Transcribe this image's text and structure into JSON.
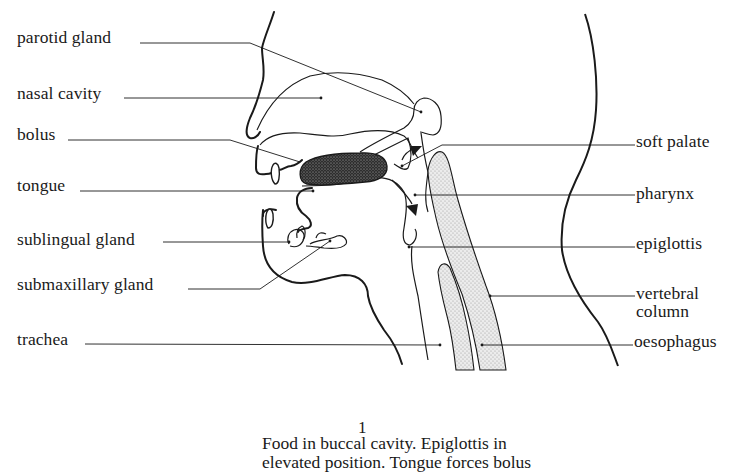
{
  "diagram": {
    "type": "anatomical-cross-section",
    "labels_left": [
      {
        "id": "parotid",
        "text": "parotid gland"
      },
      {
        "id": "nasal",
        "text": "nasal cavity"
      },
      {
        "id": "bolus",
        "text": "bolus"
      },
      {
        "id": "tongue",
        "text": "tongue"
      },
      {
        "id": "sublingual",
        "text": "sublingual gland"
      },
      {
        "id": "submaxillary",
        "text": "submaxillary gland"
      },
      {
        "id": "trachea",
        "text": "trachea"
      }
    ],
    "labels_right": [
      {
        "id": "soft_palate",
        "text": "soft palate"
      },
      {
        "id": "pharynx",
        "text": "pharynx"
      },
      {
        "id": "epiglottis",
        "text": "epiglottis"
      },
      {
        "id": "vertebral_1",
        "text": "vertebral"
      },
      {
        "id": "vertebral_2",
        "text": "column"
      },
      {
        "id": "oesophagus",
        "text": "oesophagus"
      }
    ],
    "caption": {
      "number": "1",
      "lines": [
        "Food in buccal cavity. Epiglottis in",
        "elevated position. Tongue forces bolus"
      ]
    },
    "colors": {
      "ink": "#1a1a1a",
      "stipple_fill": "#d9d9d9",
      "bolus_fill": "#3a3a3a",
      "background": "#ffffff"
    }
  }
}
